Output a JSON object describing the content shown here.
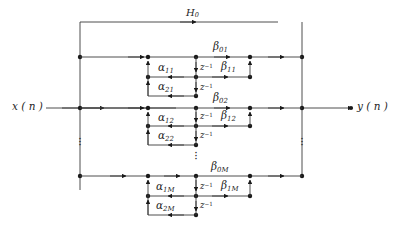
{
  "figure": {
    "type": "signal-flow-graph"
  },
  "io": {
    "input_label": "x ( n )",
    "output_label": "y ( n )"
  },
  "feedback": {
    "label_base": "H",
    "label_sub": "0"
  },
  "delay": {
    "base": "z",
    "exponent": "−1"
  },
  "sections": [
    {
      "id": "section-1",
      "numerator_direct": {
        "base": "β",
        "sub": "01"
      },
      "numerator_first": {
        "base": "β",
        "sub": "11"
      },
      "denominator_first": {
        "base": "α",
        "sub": "11"
      },
      "denominator_second": {
        "base": "α",
        "sub": "21"
      }
    },
    {
      "id": "section-2",
      "numerator_direct": {
        "base": "β",
        "sub": "02"
      },
      "numerator_first": {
        "base": "β",
        "sub": "12"
      },
      "denominator_first": {
        "base": "α",
        "sub": "12"
      },
      "denominator_second": {
        "base": "α",
        "sub": "22"
      }
    },
    {
      "id": "section-M",
      "numerator_direct": {
        "base": "β",
        "sub": "0M"
      },
      "numerator_first": {
        "base": "β",
        "sub": "1M"
      },
      "denominator_first": {
        "base": "α",
        "sub": "1M"
      },
      "denominator_second": {
        "base": "α",
        "sub": "2M"
      }
    }
  ],
  "ellipses": {
    "glyph": "·",
    "left_rail": "vertical-ellipsis",
    "right_rail": "vertical-ellipsis",
    "center": "vertical-ellipsis",
    "center_lower": "vertical-ellipsis"
  },
  "colors": {
    "wire": "#3a3a3a",
    "node": "#1a1a1a",
    "text": "#262626",
    "background": "#ffffff"
  }
}
